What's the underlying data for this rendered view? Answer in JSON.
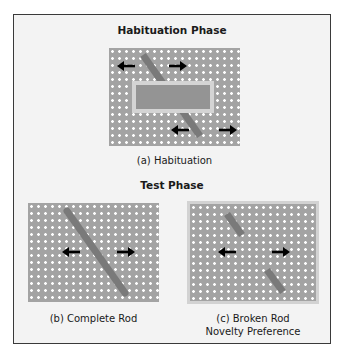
{
  "figure": {
    "habituation": {
      "heading": "Habituation Phase",
      "caption": "(a) Habituation"
    },
    "test": {
      "heading": "Test Phase",
      "panels": [
        {
          "caption_line1": "(b) Complete Rod",
          "caption_line2": ""
        },
        {
          "caption_line1": "(c) Broken Rod",
          "caption_line2": "Novelty Preference"
        }
      ]
    }
  },
  "colors": {
    "frame_border": "#3a3a3a",
    "frame_background": "#f3f3f3",
    "panel_background": "#a3a3a3",
    "dot": "#ffffff",
    "rod": "#7a7a7a",
    "occluder": "#949494",
    "occluder_border": "#d4d4d4",
    "arrow": "#000000"
  },
  "icons": {
    "arrow_left": "arrow-left-icon",
    "arrow_right": "arrow-right-icon"
  }
}
